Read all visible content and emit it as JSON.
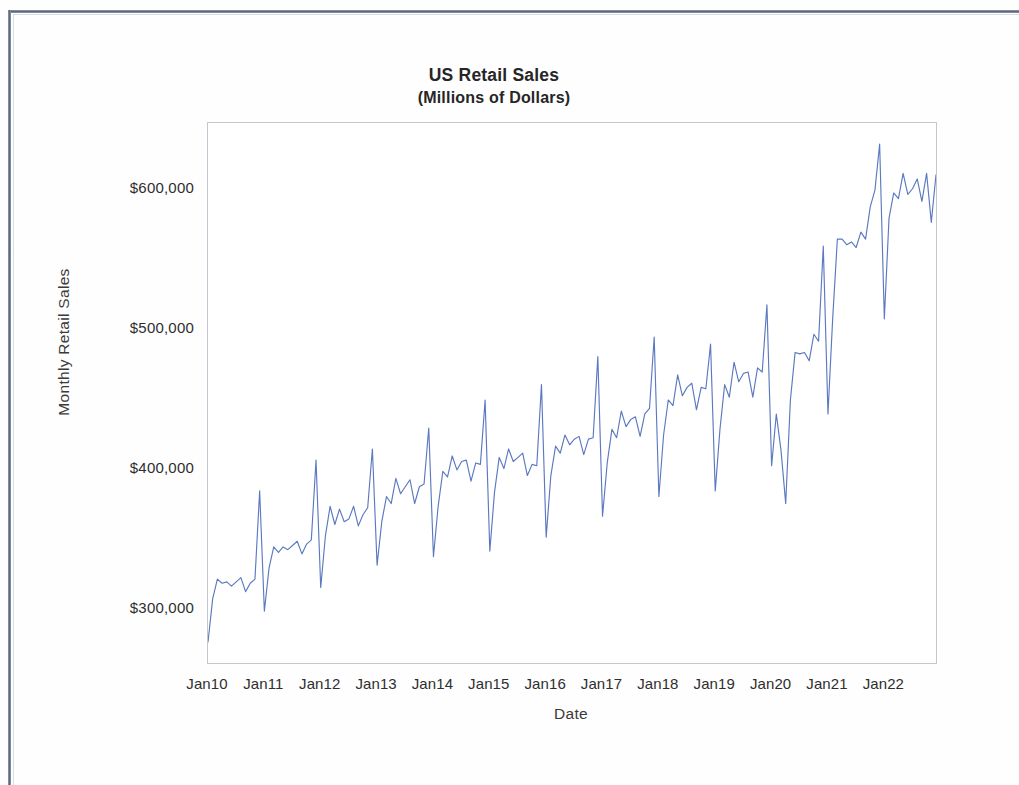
{
  "chart_data": {
    "type": "line",
    "title": "US Retail Sales",
    "subtitle": "(Millions of Dollars)",
    "xlabel": "Date",
    "ylabel": "Monthly Retail Sales",
    "line_color": "#5b79c0",
    "grid": false,
    "legend": "none",
    "ylim": [
      262000,
      648000
    ],
    "y_ticks": [
      300000,
      400000,
      500000,
      600000
    ],
    "y_tick_labels": [
      "$300,000",
      "$400,000",
      "$500,000",
      "$600,000"
    ],
    "x_tick_labels": [
      "Jan10",
      "Jan11",
      "Jan12",
      "Jan13",
      "Jan14",
      "Jan15",
      "Jan16",
      "Jan17",
      "Jan18",
      "Jan19",
      "Jan20",
      "Jan21",
      "Jan22"
    ],
    "x_tick_indices": [
      0,
      12,
      24,
      36,
      48,
      60,
      72,
      84,
      96,
      108,
      120,
      132,
      144
    ],
    "x_start": "Jan10",
    "x_end": "Dec22",
    "series": [
      {
        "name": "Monthly Retail Sales",
        "values": [
          277000,
          308000,
          322000,
          319000,
          320000,
          317000,
          320000,
          323000,
          313000,
          319000,
          322000,
          385000,
          299000,
          330000,
          345000,
          341000,
          345000,
          343000,
          346000,
          349000,
          340000,
          347000,
          350000,
          407000,
          316000,
          353000,
          374000,
          361000,
          372000,
          363000,
          365000,
          374000,
          360000,
          368000,
          373000,
          415000,
          332000,
          363000,
          381000,
          376000,
          394000,
          383000,
          388000,
          393000,
          376000,
          388000,
          390000,
          430000,
          338000,
          374000,
          399000,
          395000,
          410000,
          400000,
          406000,
          407000,
          392000,
          405000,
          404000,
          450000,
          342000,
          384000,
          409000,
          401000,
          415000,
          406000,
          409000,
          412000,
          396000,
          404000,
          403000,
          461000,
          352000,
          396000,
          417000,
          412000,
          425000,
          418000,
          422000,
          424000,
          411000,
          422000,
          423000,
          481000,
          367000,
          405000,
          429000,
          423000,
          442000,
          431000,
          436000,
          438000,
          424000,
          440000,
          444000,
          495000,
          381000,
          425000,
          450000,
          446000,
          468000,
          453000,
          459000,
          462000,
          443000,
          459000,
          458000,
          490000,
          385000,
          429000,
          461000,
          452000,
          477000,
          463000,
          469000,
          470000,
          452000,
          473000,
          470000,
          518000,
          403000,
          440000,
          414000,
          376000,
          450000,
          484000,
          483000,
          484000,
          478000,
          497000,
          492000,
          560000,
          440000,
          508000,
          565000,
          565000,
          561000,
          563000,
          559000,
          570000,
          565000,
          588000,
          600000,
          633000,
          508000,
          580000,
          598000,
          594000,
          612000,
          597000,
          601000,
          608000,
          592000,
          612000,
          577000,
          611000
        ]
      }
    ]
  },
  "figure": {
    "title": "US Retail Sales",
    "subtitle": "(Millions of Dollars)",
    "x_axis_title": "Date",
    "y_axis_title": "Monthly Retail Sales"
  }
}
